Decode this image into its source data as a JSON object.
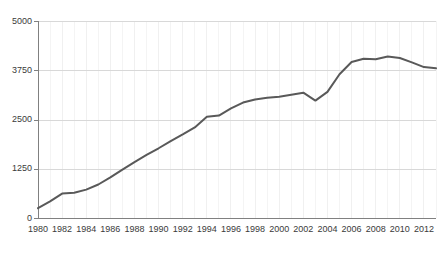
{
  "chart_data": {
    "type": "line",
    "title": "",
    "subtitle": "",
    "xlabel": "",
    "ylabel": "",
    "xlim": [
      1980,
      2013
    ],
    "ylim": [
      0,
      5000
    ],
    "grid": true,
    "legend": null,
    "legend_position": "none",
    "line_color": "#595959",
    "axis_color": "#808080",
    "grid_color": "#d8d8d8",
    "vgrid_color": "#f0f0f0",
    "text_color": "#3a3a3a",
    "ytick_labels": [
      "0",
      "1250",
      "2500",
      "3750",
      "5000"
    ],
    "ytick_values": [
      0,
      1250,
      2500,
      3750,
      5000
    ],
    "xtick_labels": [
      "1980",
      "1982",
      "1984",
      "1986",
      "1988",
      "1990",
      "1992",
      "1994",
      "1996",
      "1998",
      "2000",
      "2002",
      "2004",
      "2006",
      "2008",
      "2010",
      "2012"
    ],
    "xtick_values": [
      1980,
      1982,
      1984,
      1986,
      1988,
      1990,
      1992,
      1994,
      1996,
      1998,
      2000,
      2002,
      2004,
      2006,
      2008,
      2010,
      2012
    ],
    "x": [
      1980,
      1981,
      1982,
      1983,
      1984,
      1985,
      1986,
      1987,
      1988,
      1989,
      1990,
      1991,
      1992,
      1993,
      1994,
      1995,
      1996,
      1997,
      1998,
      1999,
      2000,
      2001,
      2002,
      2003,
      2004,
      2005,
      2006,
      2007,
      2008,
      2009,
      2010,
      2011,
      2012,
      2013
    ],
    "values": [
      250,
      420,
      620,
      640,
      720,
      850,
      1030,
      1230,
      1420,
      1600,
      1770,
      1950,
      2120,
      2300,
      2570,
      2600,
      2780,
      2930,
      3010,
      3050,
      3080,
      3130,
      3180,
      2980,
      3200,
      3650,
      3960,
      4040,
      4030,
      4100,
      4060,
      3950,
      3830,
      3800
    ],
    "series": [
      {
        "name": "series-1",
        "values": [
          250,
          420,
          620,
          640,
          720,
          850,
          1030,
          1230,
          1420,
          1600,
          1770,
          1950,
          2120,
          2300,
          2570,
          2600,
          2780,
          2930,
          3010,
          3050,
          3080,
          3130,
          3180,
          2980,
          3200,
          3650,
          3960,
          4040,
          4030,
          4100,
          4060,
          3950,
          3830,
          3800
        ]
      }
    ]
  }
}
